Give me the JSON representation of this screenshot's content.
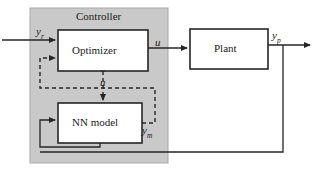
{
  "diagram": {
    "container": {
      "label": "Controller",
      "fill": "#c9c9c9",
      "border": "#8f8f8f"
    },
    "blocks": [
      {
        "id": "optimizer",
        "label": "Optimizer",
        "x": 58,
        "y": 30,
        "w": 90,
        "h": 41
      },
      {
        "id": "nn-model",
        "label": "NN model",
        "x": 58,
        "y": 103,
        "w": 84,
        "h": 40
      },
      {
        "id": "plant",
        "label": "Plant",
        "x": 190,
        "y": 29,
        "w": 78,
        "h": 40
      }
    ],
    "signals": [
      {
        "id": "reference",
        "base": "y",
        "subscript": "r",
        "x": 36,
        "y": 22
      },
      {
        "id": "control",
        "base": "u",
        "subscript": "",
        "x": 155,
        "y": 33
      },
      {
        "id": "control-estimate",
        "base": "u",
        "subscript": "",
        "tilde": true,
        "x": 103,
        "y": 72
      },
      {
        "id": "model-output",
        "base": "y",
        "subscript": "m",
        "x": 143,
        "y": 121
      },
      {
        "id": "plant-output",
        "base": "y",
        "subscript": "p",
        "x": 272,
        "y": 27
      }
    ],
    "line_styles": {
      "solid": "#262626",
      "dashed": "#262626"
    },
    "notes": {
      "solid_paths": "yr into Optimizer; Optimizer u to Plant; Plant yp out right and down to bottom feedback into Optimizer region; bottom loop from NN model back to NN model input",
      "dashed_paths": "Optimizer utilde down into NN model; NN model ym up and around left back into Optimizer second input"
    }
  }
}
